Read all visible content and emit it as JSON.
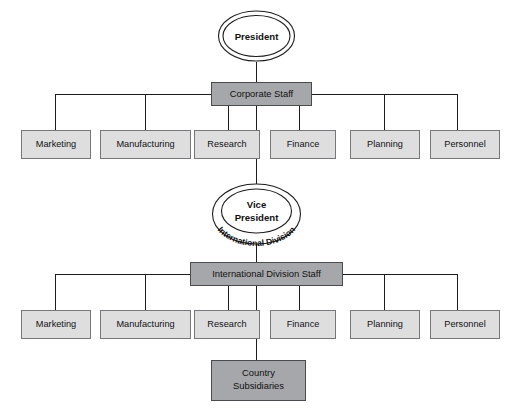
{
  "diagram": {
    "type": "organization-chart",
    "background_color": "#ffffff",
    "colors": {
      "department_box_fill": "#dededf",
      "department_box_border": "#76777a",
      "staff_box_fill": "#a6a7aa",
      "staff_box_border": "#4a4b4e",
      "ellipse_fill": "#ffffff",
      "line_color": "#1c1c1c",
      "text_color": "#111111"
    }
  },
  "nodes": {
    "president": {
      "label": "President",
      "shape": "double-ellipse"
    },
    "corporate_staff": {
      "label": "Corporate Staff",
      "shape": "box",
      "emphasis": "dark"
    },
    "vice_president": {
      "label_line1": "Vice",
      "label_line2": "President",
      "curved_label": "International Division",
      "shape": "double-ellipse"
    },
    "international_division_staff": {
      "label": "International Division Staff",
      "shape": "box",
      "emphasis": "dark"
    },
    "country_subsidiaries": {
      "label_line1": "Country",
      "label_line2": "Subsidiaries",
      "shape": "box",
      "emphasis": "dark"
    }
  },
  "corporate_departments": [
    {
      "label": "Marketing"
    },
    {
      "label": "Manufacturing"
    },
    {
      "label": "Research"
    },
    {
      "label": "Finance"
    },
    {
      "label": "Planning"
    },
    {
      "label": "Personnel"
    }
  ],
  "international_departments": [
    {
      "label": "Marketing"
    },
    {
      "label": "Manufacturing"
    },
    {
      "label": "Research"
    },
    {
      "label": "Finance"
    },
    {
      "label": "Planning"
    },
    {
      "label": "Personnel"
    }
  ]
}
